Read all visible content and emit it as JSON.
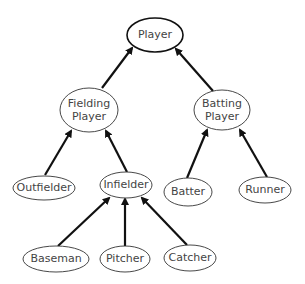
{
  "diagram": {
    "type": "class-hierarchy",
    "colors": {
      "background": "#ffffff",
      "edge": "#111111",
      "node_border": "#333333",
      "text": "#444444"
    },
    "nodes": [
      {
        "id": "player",
        "label_lines": [
          "Player"
        ],
        "cx": 155,
        "cy": 35,
        "rx": 28,
        "ry": 17,
        "root": true
      },
      {
        "id": "fielding_player",
        "label_lines": [
          "Fielding",
          "Player"
        ],
        "cx": 89,
        "cy": 110,
        "rx": 29,
        "ry": 22
      },
      {
        "id": "batting_player",
        "label_lines": [
          "Batting",
          "Player"
        ],
        "cx": 222,
        "cy": 110,
        "rx": 28,
        "ry": 20
      },
      {
        "id": "outfielder",
        "label_lines": [
          "Outfielder"
        ],
        "cx": 44,
        "cy": 188,
        "rx": 31,
        "ry": 12
      },
      {
        "id": "infielder",
        "label_lines": [
          "Infielder"
        ],
        "cx": 126,
        "cy": 185,
        "rx": 26,
        "ry": 13
      },
      {
        "id": "batter",
        "label_lines": [
          "Batter"
        ],
        "cx": 188,
        "cy": 192,
        "rx": 24,
        "ry": 14
      },
      {
        "id": "runner",
        "label_lines": [
          "Runner"
        ],
        "cx": 265,
        "cy": 190,
        "rx": 26,
        "ry": 13
      },
      {
        "id": "baseman",
        "label_lines": [
          "Baseman"
        ],
        "cx": 56,
        "cy": 259,
        "rx": 33,
        "ry": 13
      },
      {
        "id": "pitcher",
        "label_lines": [
          "Pitcher"
        ],
        "cx": 125,
        "cy": 259,
        "rx": 25,
        "ry": 13
      },
      {
        "id": "catcher",
        "label_lines": [
          "Catcher"
        ],
        "cx": 190,
        "cy": 258,
        "rx": 26,
        "ry": 13
      }
    ],
    "edges": [
      {
        "from": "fielding_player",
        "to": "player",
        "x1": 102,
        "y1": 88,
        "x2": 132,
        "y2": 48
      },
      {
        "from": "batting_player",
        "to": "player",
        "x1": 213,
        "y1": 91,
        "x2": 176,
        "y2": 49
      },
      {
        "from": "outfielder",
        "to": "fielding_player",
        "x1": 45,
        "y1": 175,
        "x2": 71,
        "y2": 131
      },
      {
        "from": "infielder",
        "to": "fielding_player",
        "x1": 127,
        "y1": 172,
        "x2": 106,
        "y2": 131
      },
      {
        "from": "batter",
        "to": "batting_player",
        "x1": 187,
        "y1": 178,
        "x2": 207,
        "y2": 130
      },
      {
        "from": "runner",
        "to": "batting_player",
        "x1": 267,
        "y1": 177,
        "x2": 240,
        "y2": 130
      },
      {
        "from": "baseman",
        "to": "infielder",
        "x1": 58,
        "y1": 246,
        "x2": 109,
        "y2": 198
      },
      {
        "from": "pitcher",
        "to": "infielder",
        "x1": 125,
        "y1": 246,
        "x2": 125,
        "y2": 199
      },
      {
        "from": "catcher",
        "to": "infielder",
        "x1": 187,
        "y1": 245,
        "x2": 142,
        "y2": 198
      }
    ]
  }
}
